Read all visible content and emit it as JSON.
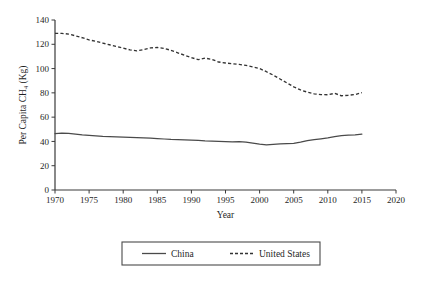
{
  "chart_data": {
    "type": "line",
    "title": "",
    "xlabel": "Year",
    "ylabel": "Per Capita CH₄ (Kg)",
    "xlim": [
      1970,
      2020
    ],
    "ylim": [
      0,
      140
    ],
    "xticks": [
      1970,
      1975,
      1980,
      1985,
      1990,
      1995,
      2000,
      2005,
      2010,
      2015,
      2020
    ],
    "yticks": [
      0,
      20,
      40,
      60,
      80,
      100,
      120,
      140
    ],
    "grid": false,
    "legend_position": "bottom",
    "x": [
      1970,
      1971,
      1972,
      1973,
      1974,
      1975,
      1976,
      1977,
      1978,
      1979,
      1980,
      1981,
      1982,
      1983,
      1984,
      1985,
      1986,
      1987,
      1988,
      1989,
      1990,
      1991,
      1992,
      1993,
      1994,
      1995,
      1996,
      1997,
      1998,
      1999,
      2000,
      2001,
      2002,
      2003,
      2004,
      2005,
      2006,
      2007,
      2008,
      2009,
      2010,
      2011,
      2012,
      2013,
      2014,
      2015
    ],
    "series": [
      {
        "name": "China",
        "style": "solid",
        "color": "#4a4a4a",
        "values": [
          46.5,
          46.8,
          46.6,
          46.0,
          45.4,
          45.0,
          44.6,
          44.2,
          44.0,
          43.8,
          43.6,
          43.4,
          43.2,
          43.0,
          42.8,
          42.4,
          42.0,
          41.6,
          41.4,
          41.2,
          41.0,
          40.8,
          40.4,
          40.2,
          40.0,
          39.8,
          39.6,
          39.8,
          39.4,
          38.6,
          37.8,
          37.2,
          37.6,
          38.0,
          38.2,
          38.4,
          39.4,
          40.6,
          41.4,
          42.2,
          43.0,
          44.0,
          44.8,
          45.2,
          45.4,
          46.0
        ]
      },
      {
        "name": "United States",
        "style": "dashed",
        "color": "#333333",
        "values": [
          129.0,
          129.0,
          128.4,
          127.0,
          125.4,
          123.6,
          122.4,
          121.0,
          119.6,
          118.2,
          116.8,
          115.4,
          114.6,
          115.6,
          117.0,
          117.4,
          116.6,
          115.0,
          113.0,
          111.0,
          109.0,
          107.4,
          108.6,
          107.6,
          105.4,
          104.6,
          104.0,
          103.4,
          102.6,
          101.4,
          100.0,
          97.4,
          94.6,
          91.4,
          88.2,
          85.0,
          82.4,
          80.6,
          79.2,
          78.6,
          78.4,
          79.6,
          77.6,
          78.0,
          78.6,
          80.2
        ]
      }
    ]
  },
  "legend": {
    "items": [
      {
        "label": "China",
        "style": "solid"
      },
      {
        "label": "United States",
        "style": "dashed"
      }
    ]
  }
}
